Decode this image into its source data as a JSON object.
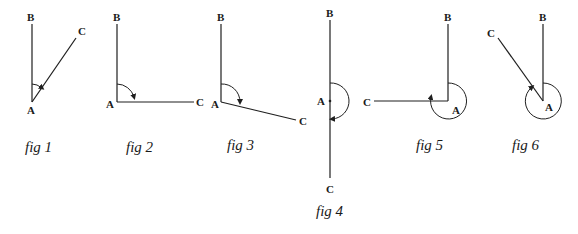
{
  "figures": [
    {
      "id": "fig1",
      "caption": "fig 1",
      "labels": {
        "vertex": "A",
        "arm1": "B",
        "arm2": "C"
      },
      "angle_type": "acute"
    },
    {
      "id": "fig2",
      "caption": "fig 2",
      "labels": {
        "vertex": "A",
        "arm1": "B",
        "arm2": "C"
      },
      "angle_type": "right"
    },
    {
      "id": "fig3",
      "caption": "fig 3",
      "labels": {
        "vertex": "A",
        "arm1": "B",
        "arm2": "C"
      },
      "angle_type": "obtuse"
    },
    {
      "id": "fig4",
      "caption": "fig 4",
      "labels": {
        "vertex": "A",
        "arm1": "B",
        "arm2": "C"
      },
      "angle_type": "straight"
    },
    {
      "id": "fig5",
      "caption": "fig 5",
      "labels": {
        "vertex": "A",
        "arm1": "B",
        "arm2": "C"
      },
      "angle_type": "reflex"
    },
    {
      "id": "fig6",
      "caption": "fig 6",
      "labels": {
        "vertex": "A",
        "arm1": "B",
        "arm2": "C"
      },
      "angle_type": "reflex"
    }
  ],
  "colors": {
    "line": "#1f1f1f",
    "background": "#ffffff"
  }
}
